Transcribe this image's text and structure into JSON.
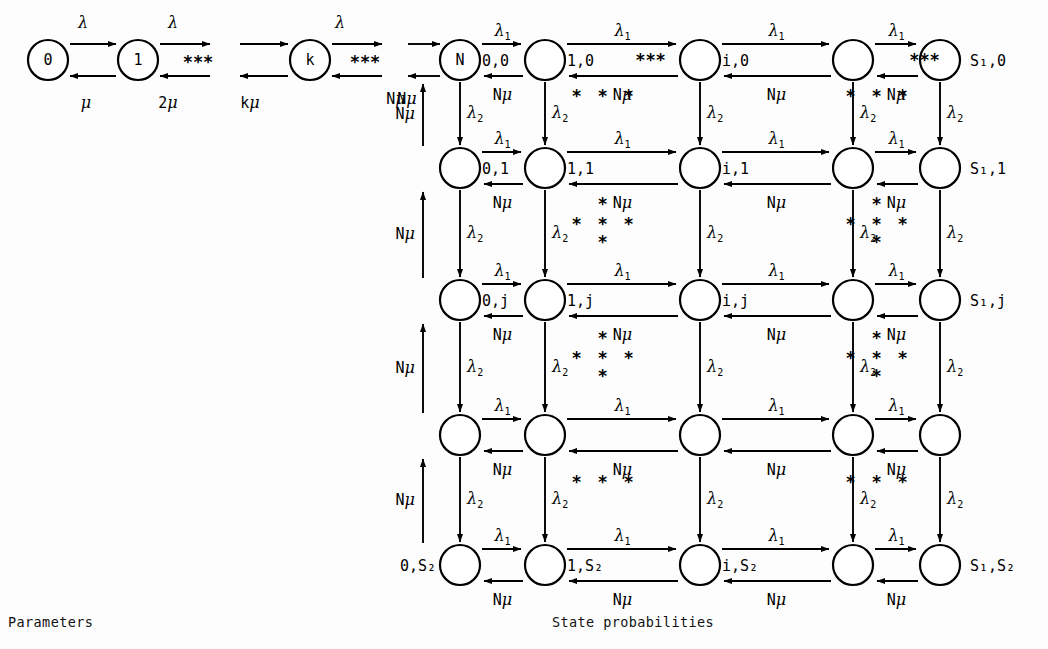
{
  "figure": {
    "type": "markov-chain-state-transition-diagram",
    "captions": [
      {
        "id": "parameters",
        "text": "Parameters",
        "x": 8,
        "y": 614
      },
      {
        "id": "state-probabilities",
        "text": "State probabilities",
        "x": 552,
        "y": 614
      }
    ]
  },
  "birth_death_chain": {
    "nodes": [
      {
        "id": "n0",
        "label": "0",
        "cx": 48,
        "cy": 60
      },
      {
        "id": "n1",
        "label": "1",
        "cx": 138,
        "cy": 60
      },
      {
        "id": "nk",
        "label": "k",
        "cx": 310,
        "cy": 60
      }
    ],
    "ellipses": [
      {
        "id": "ell-1",
        "text": "***",
        "x": 198,
        "y": 68
      },
      {
        "id": "ell-2",
        "text": "***",
        "x": 365,
        "y": 68
      }
    ],
    "forward_labels": [
      {
        "id": "f0",
        "base": "λ",
        "sub": "",
        "x": 83,
        "y": 28
      },
      {
        "id": "f1",
        "base": "λ",
        "sub": "",
        "x": 173,
        "y": 28
      },
      {
        "id": "f2",
        "base": "λ",
        "sub": "",
        "x": 340,
        "y": 28
      }
    ],
    "backward_labels": [
      {
        "id": "b0",
        "base": "μ",
        "prefix": "",
        "x": 86,
        "y": 108
      },
      {
        "id": "b1",
        "base": "μ",
        "prefix": "2",
        "x": 168,
        "y": 108
      },
      {
        "id": "b2",
        "base": "μ",
        "prefix": "k",
        "x": 250,
        "y": 108
      },
      {
        "id": "b3",
        "base": "μ",
        "prefix": "N",
        "x": 396,
        "y": 104
      }
    ]
  },
  "grid": {
    "columns_x": [
      460,
      545,
      700,
      853,
      940
    ],
    "rows_y": [
      60,
      168,
      300,
      435,
      565
    ],
    "node_radius": 20,
    "first_node_label": "N",
    "row_state_labels": [
      {
        "row": 0,
        "left": "0,0",
        "col1": "1,0",
        "col2": "i,0",
        "right": "S₁,0"
      },
      {
        "row": 1,
        "left": "0,1",
        "col1": "1,1",
        "col2": "i,1",
        "right": "S₁,1"
      },
      {
        "row": 2,
        "left": "0,j",
        "col1": "1,j",
        "col2": "i,j",
        "right": "S₁,j"
      },
      {
        "row": 3,
        "left": "",
        "col1": "",
        "col2": "",
        "right": ""
      },
      {
        "row": 4,
        "left": "0,S₂",
        "col1": "1,S₂",
        "col2": "i,S₂",
        "right": "S₁,S₂"
      }
    ],
    "horizontal_forward_rate": "λ₁",
    "horizontal_backward_rate": "Nμ",
    "vertical_forward_rate": "λ₂",
    "vertical_return_rate": "Nμ",
    "row_ellipsis_text": "***",
    "row_ellipsis_columns": [
      1,
      3
    ],
    "gap_star_patterns": [
      {
        "gap": 0,
        "kind": "horizontal"
      },
      {
        "gap": 1,
        "kind": "cross"
      },
      {
        "gap": 2,
        "kind": "cross"
      },
      {
        "gap": 3,
        "kind": "horizontal"
      }
    ]
  },
  "entry_edge": {
    "from": "k-chain",
    "to": "N",
    "forward_rate": "λ",
    "backward_rate": "Nμ",
    "return_rate": "Nμ"
  }
}
